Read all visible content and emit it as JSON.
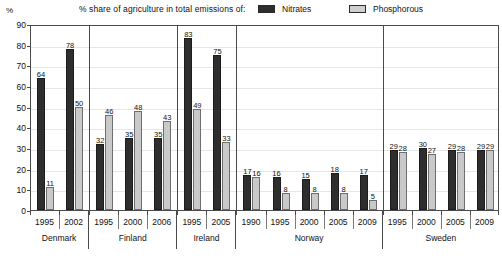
{
  "axis_unit": "%",
  "legend": {
    "title": "% share of agriculture in total emissions of:",
    "entries": [
      {
        "label": "Nitrates",
        "color": "#2e2e2e",
        "swatch": "dark"
      },
      {
        "label": "Phosphorous",
        "color": "#c9c9c9",
        "swatch": "light"
      }
    ]
  },
  "footnote": "",
  "chart_data": {
    "type": "bar",
    "title": "% share of agriculture in total emissions of:",
    "xlabel": "",
    "ylabel": "%",
    "ylim": [
      0,
      90
    ],
    "yticks": [
      0,
      10,
      20,
      30,
      40,
      50,
      60,
      70,
      80,
      90
    ],
    "grid": true,
    "legend_position": "top",
    "series": [
      {
        "name": "Nitrates",
        "color": "#2e2e2e"
      },
      {
        "name": "Phosphorous",
        "color": "#c9c9c9"
      }
    ],
    "groups": [
      {
        "country": "Denmark",
        "points": [
          {
            "year": "1995",
            "nitrates": 64,
            "phosphorous": 11
          },
          {
            "year": "2002",
            "nitrates": 78,
            "phosphorous": 50
          }
        ]
      },
      {
        "country": "Finland",
        "points": [
          {
            "year": "1995",
            "nitrates": 32,
            "phosphorous": 46
          },
          {
            "year": "2000",
            "nitrates": 35,
            "phosphorous": 48
          },
          {
            "year": "2006",
            "nitrates": 35,
            "phosphorous": 43
          }
        ]
      },
      {
        "country": "Ireland",
        "points": [
          {
            "year": "1995",
            "nitrates": 83,
            "phosphorous": 49
          },
          {
            "year": "2005",
            "nitrates": 75,
            "phosphorous": 33
          }
        ]
      },
      {
        "country": "Norway",
        "points": [
          {
            "year": "1990",
            "nitrates": 17,
            "phosphorous": 16
          },
          {
            "year": "1995",
            "nitrates": 16,
            "phosphorous": 8
          },
          {
            "year": "2000",
            "nitrates": 15,
            "phosphorous": 8
          },
          {
            "year": "2005",
            "nitrates": 18,
            "phosphorous": 8
          },
          {
            "year": "2009",
            "nitrates": 17,
            "phosphorous": 5
          }
        ]
      },
      {
        "country": "Sweden",
        "points": [
          {
            "year": "1995",
            "nitrates": 29,
            "phosphorous": 28
          },
          {
            "year": "2000",
            "nitrates": 30,
            "phosphorous": 27
          },
          {
            "year": "2005",
            "nitrates": 29,
            "phosphorous": 28
          },
          {
            "year": "2009",
            "nitrates": 29,
            "phosphorous": 29
          }
        ]
      }
    ]
  }
}
